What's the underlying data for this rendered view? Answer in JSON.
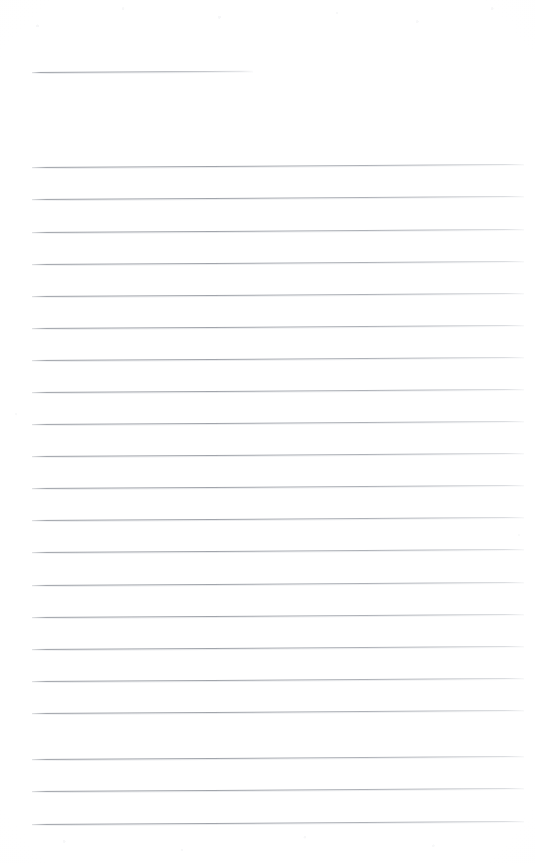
{
  "document": {
    "kind": "scanned-lined-paper",
    "title_text": "",
    "body_text": "",
    "page_width": 535,
    "page_height": 863,
    "background_color": "#ffffff",
    "rule_color": "#9ca0a7",
    "rule_thickness_px": 1,
    "rule_spacing_px": 32.2,
    "rule_skew_degrees": -0.35
  },
  "header_rule": {
    "name": "title-rule",
    "x": 32,
    "y": 72,
    "width": 221,
    "label": ""
  },
  "body_rules": [
    {
      "index": 1,
      "x": 32,
      "y": 167,
      "width": 492,
      "content": ""
    },
    {
      "index": 2,
      "x": 32,
      "y": 199,
      "width": 492,
      "content": ""
    },
    {
      "index": 3,
      "x": 32,
      "y": 232,
      "width": 492,
      "content": ""
    },
    {
      "index": 4,
      "x": 32,
      "y": 264,
      "width": 492,
      "content": ""
    },
    {
      "index": 5,
      "x": 32,
      "y": 296,
      "width": 492,
      "content": ""
    },
    {
      "index": 6,
      "x": 32,
      "y": 328,
      "width": 492,
      "content": ""
    },
    {
      "index": 7,
      "x": 32,
      "y": 360,
      "width": 492,
      "content": ""
    },
    {
      "index": 8,
      "x": 32,
      "y": 392,
      "width": 492,
      "content": ""
    },
    {
      "index": 9,
      "x": 32,
      "y": 424,
      "width": 492,
      "content": ""
    },
    {
      "index": 10,
      "x": 32,
      "y": 456,
      "width": 492,
      "content": ""
    },
    {
      "index": 11,
      "x": 32,
      "y": 488,
      "width": 492,
      "content": ""
    },
    {
      "index": 12,
      "x": 32,
      "y": 520,
      "width": 492,
      "content": ""
    },
    {
      "index": 13,
      "x": 32,
      "y": 552,
      "width": 492,
      "content": ""
    },
    {
      "index": 14,
      "x": 32,
      "y": 585,
      "width": 492,
      "content": ""
    },
    {
      "index": 15,
      "x": 32,
      "y": 617,
      "width": 492,
      "content": ""
    },
    {
      "index": 16,
      "x": 32,
      "y": 649,
      "width": 492,
      "content": ""
    },
    {
      "index": 17,
      "x": 32,
      "y": 681,
      "width": 492,
      "content": ""
    },
    {
      "index": 18,
      "x": 32,
      "y": 713,
      "width": 492,
      "content": ""
    },
    {
      "index": 19,
      "x": 32,
      "y": 759,
      "width": 492,
      "content": ""
    },
    {
      "index": 20,
      "x": 32,
      "y": 791,
      "width": 492,
      "content": ""
    },
    {
      "index": 21,
      "x": 32,
      "y": 824,
      "width": 492,
      "content": ""
    }
  ]
}
